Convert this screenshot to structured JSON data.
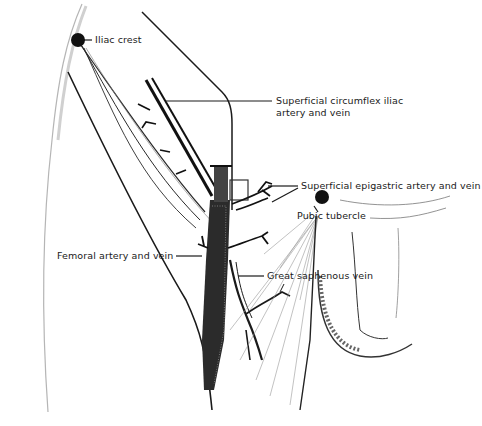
{
  "figure": {
    "type": "anatomical line illustration"
  },
  "colors": {
    "ink": "#1a1a1a",
    "background": "#ffffff",
    "shading": "#9a9a9a"
  },
  "labels": {
    "iliac_crest": "Iliac crest",
    "superficial_circumflex_line1": "Superficial circumflex iliac",
    "superficial_circumflex_line2": "artery and vein",
    "superficial_epigastric": "Superficial epigastric artery and vein",
    "pubic_tubercle": "Pubic tubercle",
    "femoral": "Femoral artery and vein",
    "great_saphenous": "Great saphenous vein"
  },
  "landmarks": [
    {
      "name": "Iliac crest",
      "marker": "filled-circle",
      "x": 78,
      "y": 40
    },
    {
      "name": "Pubic tubercle",
      "marker": "filled-circle",
      "x": 322,
      "y": 197
    }
  ]
}
